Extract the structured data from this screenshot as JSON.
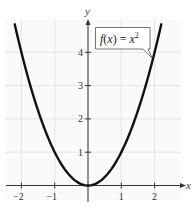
{
  "chart_data": {
    "type": "line",
    "title": "",
    "xlabel": "x",
    "ylabel": "y",
    "xlim": [
      -2.5,
      2.8
    ],
    "ylim": [
      -0.45,
      5.0
    ],
    "grid": true,
    "x_ticks": [
      -2,
      -1,
      1,
      2
    ],
    "x_tick_labels": [
      "−2",
      "−1",
      "1",
      "2"
    ],
    "y_ticks": [
      1,
      2,
      3,
      4
    ],
    "y_tick_labels": [
      "1",
      "2",
      "3",
      "4"
    ],
    "series": [
      {
        "name": "f(x) = x^2",
        "function": "x^2",
        "x": [
          -2.2,
          -2,
          -1.5,
          -1,
          -0.5,
          0,
          0.5,
          1,
          1.5,
          2,
          2.2
        ],
        "values": [
          4.84,
          4,
          2.25,
          1,
          0.25,
          0,
          0.25,
          1,
          2.25,
          4,
          4.84
        ],
        "color": "#111111"
      }
    ],
    "annotations": [
      {
        "text_main": "f(x) = x",
        "superscript": "2",
        "points_to": [
          1.95,
          3.8
        ]
      }
    ]
  }
}
